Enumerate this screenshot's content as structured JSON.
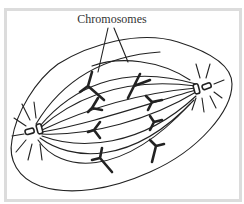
{
  "figure": {
    "label": "Chromosomes",
    "colors": {
      "frame_border": "#dcdcdc",
      "background": "#ffffff",
      "ink": "#222222",
      "label_text": "#333333"
    },
    "elements": {
      "cell_outline": "spindle-shaped cell membrane",
      "left_pole": "centrosome pair with astral fibers",
      "right_pole": "centrosome pair with astral fibers",
      "spindle_fibers": "curved microtubules between poles",
      "chromosomes": "V/Y-shaped chromatids moving toward poles"
    }
  }
}
